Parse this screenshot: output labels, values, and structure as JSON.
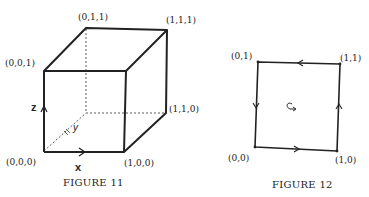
{
  "figures": [
    {
      "id": "figure-11",
      "caption": "Figure 11",
      "caption_display": "FIGURE 11",
      "kind": "unit-cube",
      "vertices": {
        "v000": "(0,0,0)",
        "v100": "(1,0,0)",
        "v110": "(1,1,0)",
        "v001": "(0,0,1)",
        "v011": "(0,1,1)",
        "v111": "(1,1,1)"
      },
      "axes": {
        "x": "x",
        "y": "y",
        "z": "z"
      }
    },
    {
      "id": "figure-12",
      "caption": "Figure 12",
      "caption_display": "FIGURE 12",
      "kind": "unit-square-oriented-boundary",
      "vertices": {
        "v00": "(0,0)",
        "v10": "(1,0)",
        "v11": "(1,1)",
        "v01": "(0,1)"
      },
      "orientation": "counterclockwise"
    }
  ],
  "colors": {
    "ink": "#222222",
    "background": "#ffffff"
  }
}
